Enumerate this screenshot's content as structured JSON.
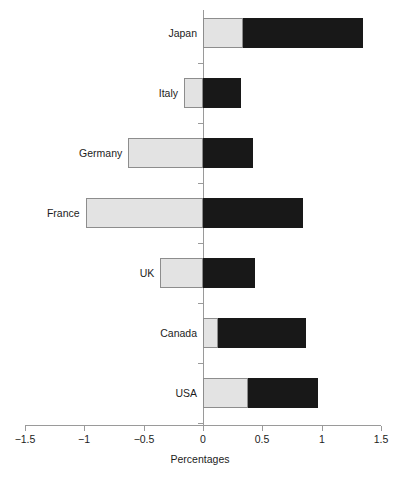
{
  "chart_data": {
    "type": "bar",
    "orientation": "horizontal",
    "title": "",
    "xlabel": "Percentages",
    "ylabel": "",
    "xlim": [
      -1.5,
      1.5
    ],
    "grid": false,
    "legend": null,
    "x_ticks": [
      {
        "value": -1.5,
        "label": "−1.5"
      },
      {
        "value": -1,
        "label": "−1"
      },
      {
        "value": -0.5,
        "label": "−0.5"
      },
      {
        "value": 0,
        "label": "0"
      },
      {
        "value": 0.5,
        "label": "0.5"
      },
      {
        "value": 1,
        "label": "1"
      },
      {
        "value": 1.5,
        "label": "1.5"
      }
    ],
    "categories": [
      "Japan",
      "Italy",
      "Germany",
      "France",
      "UK",
      "Canada",
      "USA"
    ],
    "series": [
      {
        "name": "light-segment",
        "color": "#e3e3e3",
        "values": [
          0.34,
          -0.16,
          -0.63,
          -0.99,
          -0.36,
          0.13,
          0.38
        ]
      },
      {
        "name": "dark-segment",
        "color": "#181818",
        "values": [
          1.35,
          0.32,
          0.42,
          0.84,
          0.44,
          0.87,
          0.97
        ]
      }
    ],
    "bars": [
      {
        "category": "Japan",
        "light_start": 0,
        "light_end": 0.34,
        "dark_start": 0.34,
        "dark_end": 1.35
      },
      {
        "category": "Italy",
        "light_start": -0.16,
        "light_end": 0,
        "dark_start": 0,
        "dark_end": 0.32
      },
      {
        "category": "Germany",
        "light_start": -0.63,
        "light_end": 0,
        "dark_start": 0,
        "dark_end": 0.42
      },
      {
        "category": "France",
        "light_start": -0.99,
        "light_end": 0,
        "dark_start": 0,
        "dark_end": 0.84
      },
      {
        "category": "UK",
        "light_start": -0.36,
        "light_end": 0,
        "dark_start": 0,
        "dark_end": 0.44
      },
      {
        "category": "Canada",
        "light_start": 0,
        "light_end": 0.13,
        "dark_start": 0.13,
        "dark_end": 0.87
      },
      {
        "category": "USA",
        "light_start": 0,
        "light_end": 0.38,
        "dark_start": 0.38,
        "dark_end": 0.97
      }
    ],
    "colors": {
      "light_fill": "#e3e3e3",
      "light_border": "#8d8d8d",
      "dark_fill": "#181818",
      "axis": "#9a9a9a",
      "text": "#1c1c1c",
      "background": "#ffffff"
    }
  }
}
